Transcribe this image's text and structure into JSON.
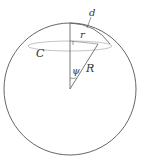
{
  "diagram": {
    "type": "sphere-cap-geometry",
    "labels": {
      "d": "d",
      "r": "r",
      "C": "C",
      "psi": "ψ",
      "R": "R"
    },
    "colors": {
      "stroke": "#555555",
      "ellipse": "#999999",
      "background": "#ffffff"
    }
  }
}
